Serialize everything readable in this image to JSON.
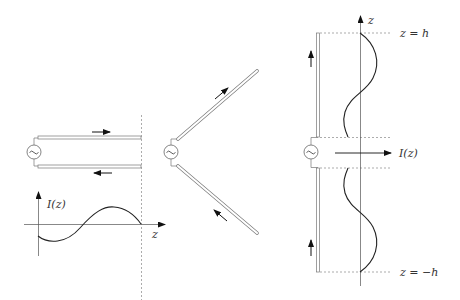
{
  "figure": {
    "colors": {
      "line": "#333333",
      "conductor": "#777777",
      "dashed": "#888888",
      "curve": "#222222",
      "background": "#ffffff"
    }
  },
  "panel_transmission_line": {
    "source_symbol": "~",
    "plot_label": "I(z)",
    "axis_label": "z"
  },
  "panel_v_antenna": {
    "source_symbol": "~"
  },
  "panel_dipole": {
    "source_symbol": "~",
    "axis_label": "z",
    "top_label": "z = h",
    "bottom_label": "z = −h",
    "current_label": "I(z)"
  }
}
